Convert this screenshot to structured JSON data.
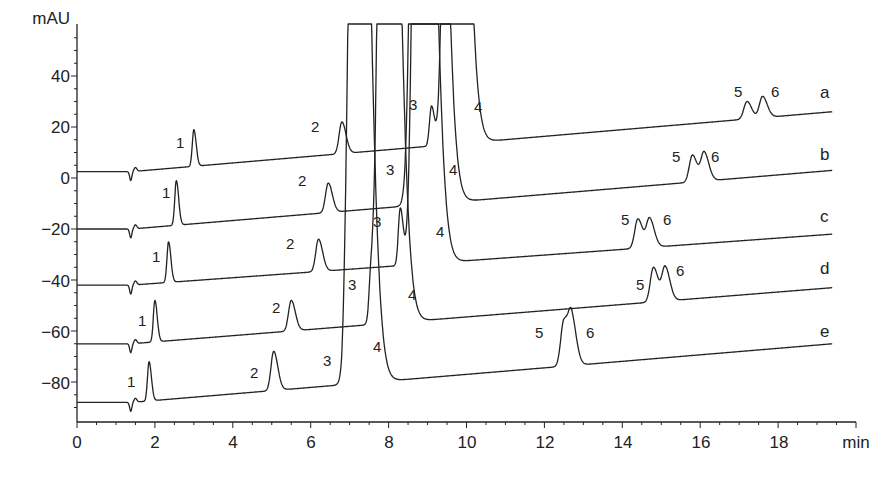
{
  "chart_data": {
    "type": "line",
    "title": "",
    "xlabel": "min",
    "ylabel": "mAU",
    "xlim": [
      0,
      20
    ],
    "ylim": [
      -95,
      58
    ],
    "x_ticks": [
      0,
      2,
      4,
      6,
      8,
      10,
      12,
      14,
      16,
      18
    ],
    "x_tick_labels": [
      "0",
      "2",
      "4",
      "6",
      "8",
      "10",
      "12",
      "14",
      "16",
      "18"
    ],
    "y_ticks": [
      40,
      20,
      0,
      -20,
      -40,
      -60,
      -80
    ],
    "y_tick_labels": [
      "40",
      "20",
      "0",
      "−20",
      "−40",
      "−60",
      "−80"
    ],
    "grid": false,
    "legend": "inline trace labels at right",
    "series": [
      {
        "name": "a",
        "baseline_start": 2.5,
        "baseline_end": 26,
        "peaks": [
          {
            "label": "1",
            "time": 3.0,
            "height": 19
          },
          {
            "label": "2",
            "time": 6.8,
            "height": 22
          },
          {
            "label": "3",
            "time": 9.1,
            "height": 28
          },
          {
            "label": "4",
            "time": 9.6,
            "height": "off-scale"
          },
          {
            "label": "5",
            "time": 17.2,
            "height": 30
          },
          {
            "label": "6",
            "time": 17.6,
            "height": 32
          }
        ]
      },
      {
        "name": "b",
        "baseline_start": -20,
        "baseline_end": 3,
        "peaks": [
          {
            "label": "1",
            "time": 2.55,
            "height": -1
          },
          {
            "label": "2",
            "time": 6.45,
            "height": -2
          },
          {
            "label": "3",
            "time": 8.75,
            "height": "off-scale"
          },
          {
            "label": "4",
            "time": 9.05,
            "height": "off-scale"
          },
          {
            "label": "5",
            "time": 15.8,
            "height": 9
          },
          {
            "label": "6",
            "time": 16.1,
            "height": 10
          }
        ]
      },
      {
        "name": "c",
        "baseline_start": -42,
        "baseline_end": -22,
        "peaks": [
          {
            "label": "1",
            "time": 2.35,
            "height": -25
          },
          {
            "label": "2",
            "time": 6.2,
            "height": -24
          },
          {
            "label": "3",
            "time": 8.3,
            "height": -12
          },
          {
            "label": "4",
            "time": 8.8,
            "height": "off-scale"
          },
          {
            "label": "5",
            "time": 14.4,
            "height": -16
          },
          {
            "label": "6",
            "time": 14.7,
            "height": -16
          }
        ]
      },
      {
        "name": "d",
        "baseline_start": -65,
        "baseline_end": -43,
        "peaks": [
          {
            "label": "1",
            "time": 2.0,
            "height": -48
          },
          {
            "label": "2",
            "time": 5.5,
            "height": -48
          },
          {
            "label": "3",
            "time": 7.55,
            "height": -41
          },
          {
            "label": "4",
            "time": 7.9,
            "height": "off-scale"
          },
          {
            "label": "5",
            "time": 14.8,
            "height": -35
          },
          {
            "label": "6",
            "time": 15.1,
            "height": -35
          }
        ]
      },
      {
        "name": "e",
        "baseline_start": -88,
        "baseline_end": -65,
        "peaks": [
          {
            "label": "1",
            "time": 1.85,
            "height": -72
          },
          {
            "label": "2",
            "time": 5.05,
            "height": -68
          },
          {
            "label": "3",
            "time": 6.9,
            "height": -64
          },
          {
            "label": "4",
            "time": 7.15,
            "height": "off-scale"
          },
          {
            "label": "5",
            "time": 12.5,
            "height": -56
          },
          {
            "label": "6",
            "time": 12.7,
            "height": -56
          }
        ]
      }
    ]
  },
  "axes": {
    "y_unit": "mAU",
    "x_unit": "min",
    "x_labels": [
      "0",
      "2",
      "4",
      "6",
      "8",
      "10",
      "12",
      "14",
      "16",
      "18"
    ],
    "y_labels": [
      "40",
      "20",
      "0",
      "−20",
      "−40",
      "−60",
      "−80"
    ]
  },
  "trace_labels": [
    "a",
    "b",
    "c",
    "d",
    "e"
  ],
  "peak_labels": {
    "a": [
      "1",
      "2",
      "3",
      "4",
      "5",
      "6"
    ],
    "b": [
      "1",
      "2",
      "3",
      "4",
      "5",
      "6"
    ],
    "c": [
      "1",
      "2",
      "3",
      "4",
      "5",
      "6"
    ],
    "d": [
      "1",
      "2",
      "3",
      "4",
      "5",
      "6"
    ],
    "e": [
      "1",
      "2",
      "3",
      "4",
      "5",
      "6"
    ]
  }
}
